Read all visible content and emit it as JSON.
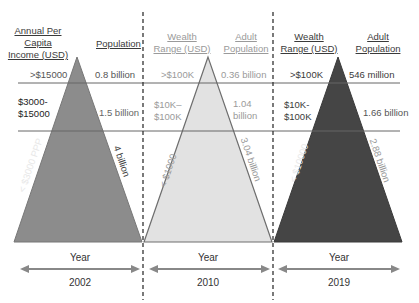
{
  "panels": [
    {
      "year_label": "Year",
      "year": "2002",
      "triangle_color": "#8c8c8c",
      "left_header": "Annual Per Capita Income (USD)",
      "left_header_lines": [
        "Annual Per",
        "Capita",
        "Income (USD)"
      ],
      "right_header": "Population",
      "tiers": [
        {
          "range": ">$15000",
          "population": "0.8 billion"
        },
        {
          "range_lines": [
            "$3000-",
            "$15000"
          ],
          "range": "$3000-$15000",
          "population": "1.5 billion"
        },
        {
          "range": "< $3000 PPP",
          "population": "4 billion"
        }
      ]
    },
    {
      "year_label": "Year",
      "year": "2010",
      "triangle_color": "#e2e2e2",
      "left_header": "Wealth Range (USD)",
      "left_header_lines": [
        "Wealth",
        "Range (USD)"
      ],
      "right_header": "Adult Population",
      "right_header_lines": [
        "Adult",
        "Population"
      ],
      "tiers": [
        {
          "range": ">$100K",
          "population": "0.36 billion"
        },
        {
          "range_lines": [
            "$10K–",
            "$100K"
          ],
          "range": "$10K–$100K",
          "population_lines": [
            "1.04",
            "billion"
          ],
          "population": "1.04 billion"
        },
        {
          "range": "< $1000",
          "population": "3.04 billion"
        }
      ]
    },
    {
      "year_label": "Year",
      "year": "2019",
      "triangle_color": "#454545",
      "left_header": "Wealth Range (USD)",
      "left_header_lines": [
        "Wealth",
        "Range (USD)"
      ],
      "right_header": "Adult Population",
      "right_header_lines": [
        "Adult",
        "Population"
      ],
      "tiers": [
        {
          "range": ">$100K",
          "population": "546 million"
        },
        {
          "range_lines": [
            "$10K-",
            "$100K"
          ],
          "range": "$10K-$100K",
          "population": "1.66 billion"
        },
        {
          "range": "< $10000",
          "population": "2.88 billion"
        }
      ]
    }
  ]
}
